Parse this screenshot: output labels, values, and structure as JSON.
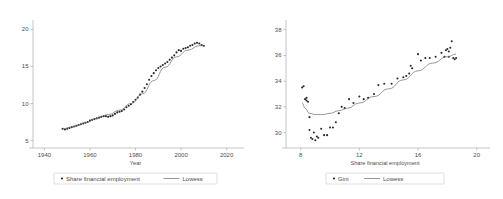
{
  "figure": {
    "panel_count": 2,
    "background": "#ffffff",
    "marker_color": "#2b2b2b",
    "line_color": "#6b6b6b",
    "axis_color": "#a0a0a0",
    "text_color": "#4c4c4c"
  },
  "chart_data": [
    {
      "type": "scatter",
      "panel": "left",
      "title": "",
      "xlabel": "Year",
      "ylabel": "",
      "xlim": [
        1935,
        2025
      ],
      "ylim": [
        4,
        21
      ],
      "xticks": [
        1940,
        1960,
        1980,
        2000,
        2020
      ],
      "yticks": [
        5,
        10,
        15,
        20
      ],
      "grid": false,
      "legend_position": "bottom",
      "legend": [
        {
          "label": "Share financial employment",
          "marker": "dot"
        },
        {
          "label": "Lowess",
          "marker": "line"
        }
      ],
      "series": [
        {
          "name": "Share financial employment",
          "marker": "dot",
          "x": [
            1948,
            1949,
            1950,
            1951,
            1952,
            1953,
            1954,
            1955,
            1956,
            1957,
            1958,
            1959,
            1960,
            1961,
            1962,
            1963,
            1964,
            1965,
            1966,
            1967,
            1968,
            1969,
            1970,
            1971,
            1972,
            1973,
            1974,
            1975,
            1976,
            1977,
            1978,
            1979,
            1980,
            1981,
            1982,
            1983,
            1984,
            1985,
            1986,
            1987,
            1988,
            1989,
            1990,
            1991,
            1992,
            1993,
            1994,
            1995,
            1996,
            1997,
            1998,
            1999,
            2000,
            2001,
            2002,
            2003,
            2004,
            2005,
            2006,
            2007,
            2008,
            2009,
            2010
          ],
          "y": [
            6.6,
            6.5,
            6.6,
            6.7,
            6.8,
            6.9,
            7.0,
            7.1,
            7.2,
            7.3,
            7.4,
            7.5,
            7.7,
            7.8,
            7.9,
            8.0,
            8.1,
            8.2,
            8.3,
            8.3,
            8.2,
            8.3,
            8.4,
            8.6,
            8.8,
            8.9,
            9.0,
            9.2,
            9.5,
            9.7,
            9.9,
            10.2,
            10.5,
            10.8,
            11.2,
            11.6,
            12.1,
            12.6,
            13.2,
            13.7,
            14.1,
            14.5,
            14.8,
            15.0,
            15.2,
            15.4,
            15.6,
            15.9,
            16.2,
            16.5,
            16.9,
            17.2,
            17.1,
            17.4,
            17.5,
            17.6,
            17.8,
            17.9,
            18.1,
            18.2,
            18.1,
            17.9,
            17.8
          ]
        },
        {
          "name": "Lowess",
          "marker": "line",
          "x": [
            1948,
            1953,
            1958,
            1963,
            1968,
            1973,
            1978,
            1983,
            1988,
            1993,
            1998,
            2003,
            2008,
            2010
          ],
          "y": [
            6.6,
            6.9,
            7.4,
            8.0,
            8.5,
            9.1,
            10.0,
            11.3,
            13.1,
            14.9,
            16.3,
            17.2,
            17.8,
            17.8
          ]
        }
      ]
    },
    {
      "type": "scatter",
      "panel": "right",
      "title": "",
      "xlabel": "Share financial employment",
      "ylabel": "",
      "xlim": [
        7,
        20.5
      ],
      "ylim": [
        28.8,
        38.6
      ],
      "xticks": [
        8,
        12,
        16,
        20
      ],
      "yticks": [
        30,
        32,
        34,
        36,
        38
      ],
      "grid": false,
      "legend_position": "bottom",
      "legend": [
        {
          "label": "Gini",
          "marker": "dot"
        },
        {
          "label": "Lowess",
          "marker": "line"
        }
      ],
      "series": [
        {
          "name": "Gini",
          "marker": "dot",
          "x": [
            8.1,
            8.2,
            8.3,
            8.4,
            8.4,
            8.5,
            8.6,
            8.6,
            8.7,
            8.8,
            8.9,
            9.0,
            9.1,
            9.2,
            9.4,
            9.6,
            9.8,
            10.0,
            10.2,
            10.4,
            10.6,
            10.8,
            11.0,
            11.3,
            11.6,
            12.0,
            12.3,
            12.6,
            13.0,
            13.3,
            13.7,
            14.2,
            14.6,
            15.0,
            15.2,
            15.4,
            15.5,
            15.6,
            16.0,
            16.2,
            16.5,
            16.8,
            17.2,
            17.6,
            17.9,
            18.0,
            18.1,
            18.2,
            18.3,
            18.4,
            18.5,
            18.6,
            18.1,
            17.8
          ],
          "y": [
            33.5,
            33.6,
            32.6,
            32.7,
            32.5,
            32.4,
            31.2,
            30.2,
            29.6,
            29.5,
            30.0,
            29.4,
            29.7,
            29.6,
            30.3,
            29.8,
            29.8,
            30.4,
            30.4,
            30.8,
            31.5,
            32.0,
            31.9,
            32.6,
            32.3,
            32.8,
            32.6,
            32.7,
            33.0,
            33.7,
            33.8,
            33.8,
            34.2,
            34.3,
            34.4,
            34.6,
            35.2,
            35.0,
            36.1,
            35.6,
            35.8,
            35.8,
            35.9,
            36.2,
            36.4,
            36.5,
            36.3,
            36.6,
            37.1,
            35.8,
            35.7,
            35.8,
            35.9,
            35.9
          ]
        },
        {
          "name": "Lowess",
          "marker": "line",
          "x": [
            8.1,
            8.3,
            8.6,
            9.0,
            9.5,
            10.0,
            10.6,
            11.2,
            12.0,
            13.0,
            14.0,
            15.0,
            16.0,
            17.0,
            18.0,
            18.6
          ],
          "y": [
            32.3,
            31.9,
            31.5,
            31.4,
            31.4,
            31.5,
            31.7,
            31.9,
            32.3,
            32.8,
            33.4,
            34.1,
            34.8,
            35.4,
            35.9,
            36.1
          ]
        }
      ]
    }
  ]
}
